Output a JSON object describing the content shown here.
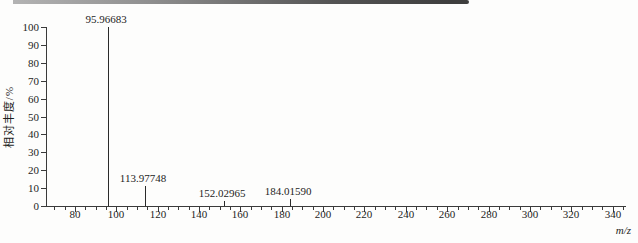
{
  "chart_data": {
    "type": "bar",
    "subtype": "mass-spectrum-stick-plot",
    "title": "",
    "xlabel": "m/z",
    "ylabel": "相对丰度/%",
    "xlim": [
      66,
      346
    ],
    "ylim": [
      0,
      100
    ],
    "grid": false,
    "legend": null,
    "y_ticks": [
      0,
      10,
      20,
      30,
      40,
      50,
      60,
      70,
      80,
      90,
      100
    ],
    "x_major_ticks": [
      80,
      100,
      120,
      140,
      160,
      180,
      200,
      220,
      240,
      260,
      280,
      300,
      320,
      340
    ],
    "x_minor_ticks": {
      "start": 70,
      "end": 345,
      "step": 5
    },
    "peaks": [
      {
        "mz": 95.96683,
        "intensity": 100,
        "label": "95.96683"
      },
      {
        "mz": 113.97748,
        "intensity": 11,
        "label": "113.97748"
      },
      {
        "mz": 152.02965,
        "intensity": 3,
        "label": "152.02965"
      },
      {
        "mz": 184.0159,
        "intensity": 4,
        "label": "184.01590"
      }
    ],
    "colors": {
      "peak": "#2a2a2a",
      "axis": "#3a3a3a",
      "text": "#1d1d1d",
      "background": "#fdfdfc",
      "scan_bar_dark": "#3e3e3e",
      "scan_bar_light": "#b3b3b3"
    }
  }
}
